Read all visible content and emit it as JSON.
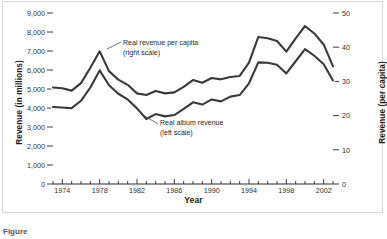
{
  "figure": {
    "caption": "Figure"
  },
  "chart_data": {
    "type": "line",
    "title": "",
    "xlabel": "Year",
    "ylabel": "Revenue (in millions)",
    "y2label": "Revenue (per capita)",
    "xlim": [
      1973,
      2003
    ],
    "ylim": [
      0,
      9000
    ],
    "y2lim": [
      0,
      50
    ],
    "grid": false,
    "legend_position": "inline-annotations",
    "x_tick_labels": [
      "1974",
      "1978",
      "1982",
      "1986",
      "1990",
      "1994",
      "1998",
      "2002"
    ],
    "x_tick_values": [
      1974,
      1978,
      1982,
      1986,
      1990,
      1994,
      1998,
      2002
    ],
    "x_minor_ticks": [
      1973,
      1975,
      1976,
      1977,
      1979,
      1980,
      1981,
      1983,
      1984,
      1985,
      1987,
      1988,
      1989,
      1991,
      1992,
      1993,
      1995,
      1996,
      1997,
      1999,
      2000,
      2001,
      2003
    ],
    "y_tick_labels": [
      "0",
      "1,000",
      "2,000",
      "3,000",
      "4,000",
      "5,000",
      "6,000",
      "7,000",
      "8,000",
      "9,000"
    ],
    "y_tick_values": [
      0,
      1000,
      2000,
      3000,
      4000,
      5000,
      6000,
      7000,
      8000,
      9000
    ],
    "y2_tick_labels": [
      "0",
      "10",
      "20",
      "30",
      "40",
      "50"
    ],
    "y2_tick_values": [
      0,
      10,
      20,
      30,
      40,
      50
    ],
    "x": [
      1973,
      1974,
      1975,
      1976,
      1977,
      1978,
      1979,
      1980,
      1981,
      1982,
      1983,
      1984,
      1985,
      1986,
      1987,
      1988,
      1989,
      1990,
      1991,
      1992,
      1993,
      1994,
      1995,
      1996,
      1997,
      1998,
      1999,
      2000,
      2001,
      2002,
      2003
    ],
    "series": [
      {
        "name": "Real revenue per capita (right scale)",
        "axis": "right",
        "color": "#3a3a3a",
        "values": [
          28.2,
          28.0,
          27.3,
          29.5,
          34.0,
          38.8,
          33.0,
          30.5,
          29.0,
          26.5,
          26.0,
          27.2,
          26.5,
          26.8,
          28.4,
          30.4,
          29.6,
          31.0,
          30.6,
          31.3,
          31.6,
          35.5,
          43.0,
          42.6,
          41.8,
          38.7,
          42.6,
          46.2,
          44.0,
          40.8,
          34.4
        ]
      },
      {
        "name": "Real album revenue (left scale)",
        "axis": "left",
        "color": "#3a3a3a",
        "values": [
          4050,
          4030,
          3990,
          4380,
          5080,
          5980,
          5200,
          4750,
          4450,
          3980,
          3420,
          3680,
          3560,
          3630,
          3950,
          4300,
          4180,
          4450,
          4350,
          4600,
          4680,
          5300,
          6400,
          6380,
          6280,
          5820,
          6460,
          7100,
          6750,
          6300,
          5450
        ]
      }
    ],
    "annotations": [
      {
        "id": "per-capita",
        "line1": "Real revenue per capita",
        "line2": "(right scale)",
        "points_to": "upper-curve-1978-peak"
      },
      {
        "id": "album",
        "line1": "Real album revenue",
        "line2": "(left scale)",
        "points_to": "lower-curve-1983-trough"
      }
    ]
  }
}
